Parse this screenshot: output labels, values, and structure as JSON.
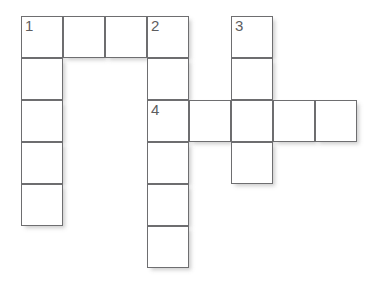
{
  "puzzle": {
    "type": "crossword-grid",
    "title": "",
    "background_color": "#ffffff",
    "cell_border_color": "#6e6e70",
    "cell_fill_color": "#ffffff",
    "number_color": "#5d5d5f",
    "shadow_color": "rgba(120,120,122,0.38)",
    "origin_x": 21,
    "origin_y": 16,
    "cell_width": 42,
    "cell_height": 42,
    "columns": 8,
    "rows": 6,
    "cells": [
      {
        "row": 0,
        "col": 0,
        "number": "1"
      },
      {
        "row": 0,
        "col": 1,
        "number": ""
      },
      {
        "row": 0,
        "col": 2,
        "number": ""
      },
      {
        "row": 0,
        "col": 3,
        "number": "2"
      },
      {
        "row": 0,
        "col": 5,
        "number": "3"
      },
      {
        "row": 1,
        "col": 0,
        "number": ""
      },
      {
        "row": 1,
        "col": 3,
        "number": ""
      },
      {
        "row": 1,
        "col": 5,
        "number": ""
      },
      {
        "row": 2,
        "col": 0,
        "number": ""
      },
      {
        "row": 2,
        "col": 3,
        "number": "4"
      },
      {
        "row": 2,
        "col": 4,
        "number": ""
      },
      {
        "row": 2,
        "col": 5,
        "number": ""
      },
      {
        "row": 2,
        "col": 6,
        "number": ""
      },
      {
        "row": 2,
        "col": 7,
        "number": ""
      },
      {
        "row": 3,
        "col": 0,
        "number": ""
      },
      {
        "row": 3,
        "col": 3,
        "number": ""
      },
      {
        "row": 3,
        "col": 5,
        "number": ""
      },
      {
        "row": 4,
        "col": 0,
        "number": ""
      },
      {
        "row": 4,
        "col": 3,
        "number": ""
      },
      {
        "row": 5,
        "col": 3,
        "number": ""
      }
    ],
    "clue_numbers": [
      "1",
      "2",
      "3",
      "4"
    ],
    "entries": [
      {
        "number": "1",
        "direction": "across",
        "length": 4,
        "start_row": 0,
        "start_col": 0
      },
      {
        "number": "1",
        "direction": "down",
        "length": 5,
        "start_row": 0,
        "start_col": 0
      },
      {
        "number": "2",
        "direction": "down",
        "length": 6,
        "start_row": 0,
        "start_col": 3
      },
      {
        "number": "3",
        "direction": "down",
        "length": 4,
        "start_row": 0,
        "start_col": 5
      },
      {
        "number": "4",
        "direction": "across",
        "length": 5,
        "start_row": 2,
        "start_col": 3
      }
    ]
  }
}
